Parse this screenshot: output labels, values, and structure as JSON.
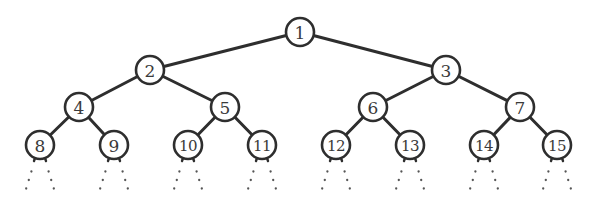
{
  "diagram": {
    "type": "complete-binary-tree",
    "levels": 4,
    "nodes": [
      {
        "id": 1,
        "label": "1",
        "x": 300,
        "y": 32,
        "parent": null
      },
      {
        "id": 2,
        "label": "2",
        "x": 150,
        "y": 70,
        "parent": 1
      },
      {
        "id": 3,
        "label": "3",
        "x": 446,
        "y": 70,
        "parent": 1
      },
      {
        "id": 4,
        "label": "4",
        "x": 79,
        "y": 107,
        "parent": 2
      },
      {
        "id": 5,
        "label": "5",
        "x": 225,
        "y": 107,
        "parent": 2
      },
      {
        "id": 6,
        "label": "6",
        "x": 373,
        "y": 107,
        "parent": 3
      },
      {
        "id": 7,
        "label": "7",
        "x": 520,
        "y": 107,
        "parent": 3
      },
      {
        "id": 8,
        "label": "8",
        "x": 40,
        "y": 145,
        "parent": 4
      },
      {
        "id": 9,
        "label": "9",
        "x": 114,
        "y": 145,
        "parent": 4
      },
      {
        "id": 10,
        "label": "10",
        "x": 188,
        "y": 145,
        "parent": 5
      },
      {
        "id": 11,
        "label": "11",
        "x": 262,
        "y": 145,
        "parent": 5
      },
      {
        "id": 12,
        "label": "12",
        "x": 336,
        "y": 145,
        "parent": 6
      },
      {
        "id": 13,
        "label": "13",
        "x": 410,
        "y": 145,
        "parent": 6
      },
      {
        "id": 14,
        "label": "14",
        "x": 484,
        "y": 145,
        "parent": 7
      },
      {
        "id": 15,
        "label": "15",
        "x": 557,
        "y": 145,
        "parent": 7
      }
    ],
    "node_radius": 14,
    "continuation": "dotted-branches",
    "colors": {
      "stroke": "#2e2e2e",
      "fill": "#ffffff",
      "text": "#3a3a3a",
      "dots": "#555555"
    }
  }
}
